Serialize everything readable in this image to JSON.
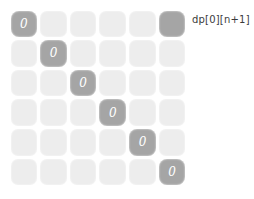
{
  "figure": {
    "caption": "dp[0][n+1]",
    "colors": {
      "background": "#ffffff",
      "cell_empty": "#ededed",
      "cell_highlight": "#a5a5a5",
      "cell_value_text": "#ffffff",
      "caption_text": "#3b3b3b"
    }
  },
  "grid": {
    "rows": 6,
    "cols": 6,
    "cells": [
      [
        {
          "value": "0",
          "highlight": true
        },
        {
          "value": "",
          "highlight": false
        },
        {
          "value": "",
          "highlight": false
        },
        {
          "value": "",
          "highlight": false
        },
        {
          "value": "",
          "highlight": false
        },
        {
          "value": "",
          "highlight": true
        }
      ],
      [
        {
          "value": "",
          "highlight": false
        },
        {
          "value": "0",
          "highlight": true
        },
        {
          "value": "",
          "highlight": false
        },
        {
          "value": "",
          "highlight": false
        },
        {
          "value": "",
          "highlight": false
        },
        {
          "value": "",
          "highlight": false
        }
      ],
      [
        {
          "value": "",
          "highlight": false
        },
        {
          "value": "",
          "highlight": false
        },
        {
          "value": "0",
          "highlight": true
        },
        {
          "value": "",
          "highlight": false
        },
        {
          "value": "",
          "highlight": false
        },
        {
          "value": "",
          "highlight": false
        }
      ],
      [
        {
          "value": "",
          "highlight": false
        },
        {
          "value": "",
          "highlight": false
        },
        {
          "value": "",
          "highlight": false
        },
        {
          "value": "0",
          "highlight": true
        },
        {
          "value": "",
          "highlight": false
        },
        {
          "value": "",
          "highlight": false
        }
      ],
      [
        {
          "value": "",
          "highlight": false
        },
        {
          "value": "",
          "highlight": false
        },
        {
          "value": "",
          "highlight": false
        },
        {
          "value": "",
          "highlight": false
        },
        {
          "value": "0",
          "highlight": true
        },
        {
          "value": "",
          "highlight": false
        }
      ],
      [
        {
          "value": "",
          "highlight": false
        },
        {
          "value": "",
          "highlight": false
        },
        {
          "value": "",
          "highlight": false
        },
        {
          "value": "",
          "highlight": false
        },
        {
          "value": "",
          "highlight": false
        },
        {
          "value": "0",
          "highlight": true
        }
      ]
    ]
  }
}
